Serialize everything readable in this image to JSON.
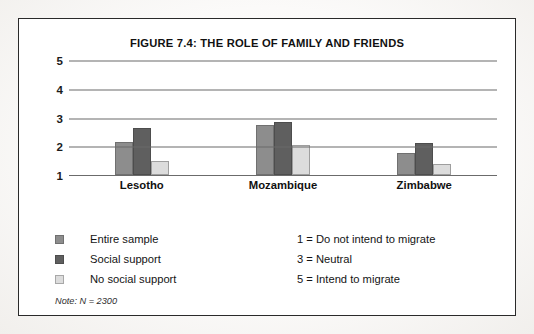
{
  "figure": {
    "title": "FIGURE 7.4: THE ROLE OF FAMILY AND FRIENDS",
    "note": "Note: N = 2300"
  },
  "legend": {
    "series": [
      {
        "label": "Entire sample",
        "color": "#8d8d8d"
      },
      {
        "label": "Social support",
        "color": "#5f5f5f"
      },
      {
        "label": "No social support",
        "color": "#dcdcdc"
      }
    ]
  },
  "scale_legend": {
    "items": [
      "1 = Do not intend to migrate",
      "3 = Neutral",
      "5 = Intend to migrate"
    ]
  },
  "chart_data": {
    "type": "bar",
    "title": "FIGURE 7.4: THE ROLE OF FAMILY AND FRIENDS",
    "xlabel": "",
    "ylabel": "",
    "categories": [
      "Lesotho",
      "Mozambique",
      "Zimbabwe"
    ],
    "series": [
      {
        "name": "Entire sample",
        "color": "#8d8d8d",
        "values": [
          2.15,
          2.75,
          1.75
        ]
      },
      {
        "name": "Social support",
        "color": "#5f5f5f",
        "values": [
          2.65,
          2.85,
          2.1
        ]
      },
      {
        "name": "No social support",
        "color": "#dcdcdc",
        "values": [
          1.5,
          2.05,
          1.4
        ]
      }
    ],
    "ylim": [
      1,
      5
    ],
    "yticks": [
      1,
      2,
      3,
      4,
      5
    ],
    "ytick_labels": [
      "1",
      "2",
      "3",
      "4",
      "5"
    ],
    "grid": true,
    "grid_axis": "y",
    "legend_position": "below-left",
    "annotations": [
      "1 = Do not intend to migrate",
      "3 = Neutral",
      "5 = Intend to migrate",
      "Note: N = 2300"
    ]
  }
}
